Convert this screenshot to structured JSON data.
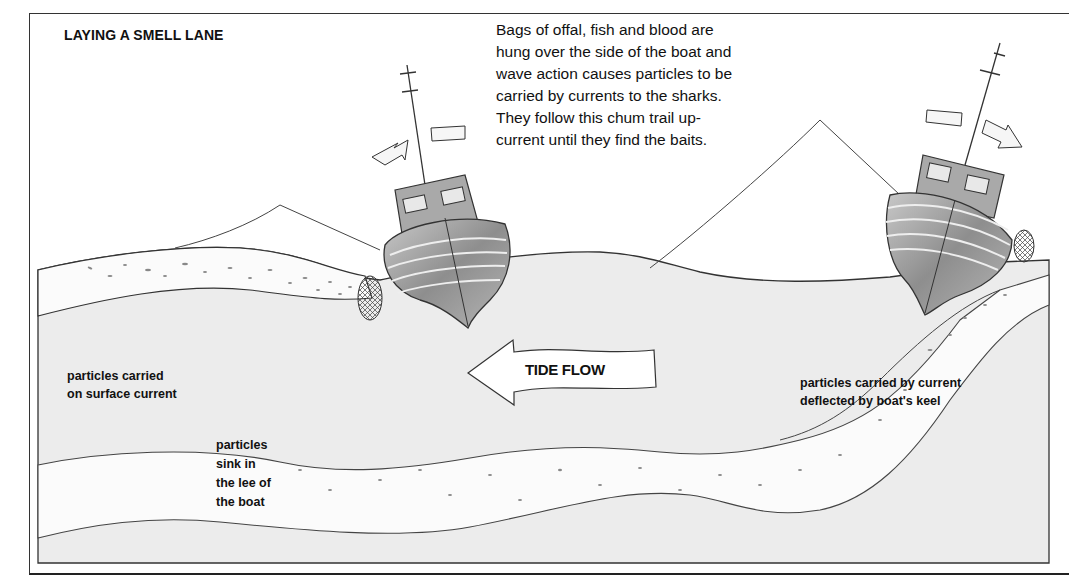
{
  "diagram": {
    "title": "LAYING A SMELL LANE",
    "caption_lines": [
      "Bags of offal, fish and blood are",
      "hung over the side of the boat and",
      "wave action causes particles to be",
      "carried by currents to the sharks.",
      "They follow this chum trail up-",
      "current until they find the baits."
    ],
    "tide_arrow": {
      "label": "TIDE FLOW",
      "direction": "left"
    },
    "labels": {
      "surface_current": [
        "particles carried",
        "on surface current"
      ],
      "sink_in_lee": [
        "particles",
        "sink in",
        "the lee of",
        "the boat"
      ],
      "keel_deflection": [
        "particles carried by current",
        "deflected by boat's keel"
      ]
    },
    "elements": [
      {
        "name": "left-fishing-boat",
        "drift_arrow": "left"
      },
      {
        "name": "right-fishing-boat",
        "drift_arrow": "right"
      },
      {
        "name": "chum-bag-net-left"
      },
      {
        "name": "chum-bag-net-right"
      },
      {
        "name": "surface-chum-trail"
      },
      {
        "name": "sinking-chum-trail"
      },
      {
        "name": "deflected-chum-trail"
      }
    ],
    "colors": {
      "sea": "#ececec",
      "trail": "#fbfbfb",
      "hull": "#9a9a9a",
      "line": "#333333"
    }
  }
}
